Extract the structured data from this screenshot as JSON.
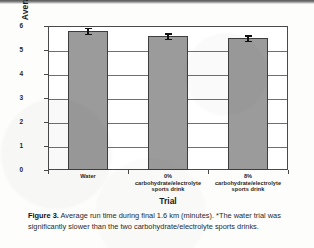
{
  "figure": {
    "caption_label": "Figure 3.",
    "caption_text": " Average run time during final 1.6 km (minutes). *The water trial was significantly slower than the two carbohydrate/electrolyte sports drinks."
  },
  "chart_data": {
    "type": "bar",
    "title": "",
    "xlabel": "Trial",
    "ylabel": "Average run time (minutes)",
    "categories": [
      "Water",
      "0%\ncarbohydrate/electrolyte\nsports drink",
      "8%\ncarbohydrate/electrolyte\nsports drink"
    ],
    "category_lines": [
      [
        "Water"
      ],
      [
        "0%",
        "carbohydrate/electrolyte",
        "sports drink"
      ],
      [
        "8%",
        "carbohydrate/electrolyte",
        "sports drink"
      ]
    ],
    "values": [
      5.8,
      5.58,
      5.5
    ],
    "errors": [
      0.13,
      0.12,
      0.12
    ],
    "ylim": [
      0,
      6
    ],
    "yticks": [
      0,
      1,
      2,
      3,
      4,
      5,
      6
    ],
    "ytick_labels": [
      "0",
      "1",
      "2",
      "3",
      "4",
      "5",
      "6"
    ],
    "grid": true,
    "grid_axis": "y",
    "legend": false,
    "bar_color": "#9b9b9b",
    "bar_edge_color": "#3d3d3d",
    "error_color": "#111111",
    "axis_color": "#4a4a4a"
  }
}
